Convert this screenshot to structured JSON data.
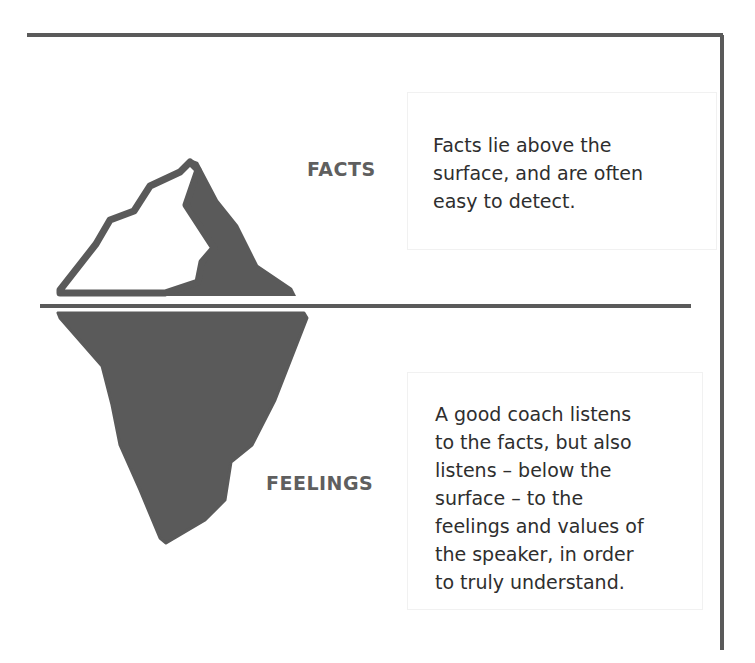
{
  "labels": {
    "facts": "FACTS",
    "feelings": "FEELINGS"
  },
  "facts_box": {
    "lines": [
      "Facts lie above the",
      "surface, and are often",
      "easy to detect."
    ]
  },
  "feelings_box": {
    "lines": [
      "A good coach listens",
      "to the facts, but also",
      "listens – below the",
      "surface – to the",
      "feelings and values of",
      "the speaker, in order",
      "to truly understand."
    ]
  },
  "colors": {
    "iceberg": "#5a5a5a",
    "frame": "#5a5a5a",
    "label": "#5f5f5f",
    "text": "#2e2e2e"
  }
}
